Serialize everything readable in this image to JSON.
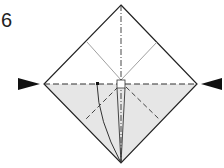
{
  "diagram": {
    "step_number": "6",
    "colors": {
      "paper_front": "#ffffff",
      "paper_back": "#e6e6e6",
      "line": "#222222",
      "arrow": "#111111"
    },
    "arrows": [
      {
        "side": "left",
        "direction": "right"
      },
      {
        "side": "right",
        "direction": "left"
      }
    ],
    "lines": [
      "valley-fold horizontal",
      "mountain-fold vertical",
      "diagonal creases"
    ]
  }
}
